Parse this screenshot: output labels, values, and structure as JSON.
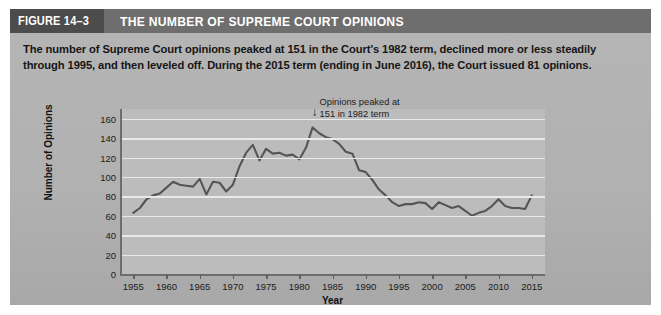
{
  "header": {
    "figure_number": "FIGURE 14–3",
    "figure_title": "THE NUMBER OF SUPREME COURT OPINIONS"
  },
  "caption": "The number of Supreme Court opinions peaked at 151 in the Court's 1982 term, declined more or less steadily through 1995, and then leveled off. During the 2015 term (ending in June 2016), the Court issued 81 opinions.",
  "annotation": {
    "line1": "Opinions peaked at",
    "line2": "151 in 1982 term",
    "arrow": "↓"
  },
  "colors": {
    "panel_background": "#b3b3b3",
    "header_band": "#6e6e6e",
    "figure_number_block": "#4c4c4c",
    "plot_background": "#bcbcbc",
    "gridline": "#e9e9e9",
    "line_series": "#555555",
    "axis": "#6d6d6d",
    "text": "#161616"
  },
  "chart_data": {
    "type": "line",
    "title": "THE NUMBER OF SUPREME COURT OPINIONS",
    "xlabel": "Year",
    "ylabel": "Number of Opinions",
    "xlim": [
      1953,
      2017
    ],
    "ylim": [
      0,
      170
    ],
    "yticks": [
      0,
      20,
      40,
      60,
      80,
      100,
      120,
      140,
      160
    ],
    "ytick_labels": [
      "0",
      "20",
      "40",
      "60",
      "80",
      "100",
      "120",
      "140",
      "160"
    ],
    "xticks": [
      1955,
      1960,
      1965,
      1970,
      1975,
      1980,
      1985,
      1990,
      1995,
      2000,
      2005,
      2010,
      2015
    ],
    "xtick_labels": [
      "1955",
      "1960",
      "1965",
      "1970",
      "1975",
      "1980",
      "1985",
      "1990",
      "1995",
      "2000",
      "2005",
      "2010",
      "2015"
    ],
    "grid": true,
    "legend": false,
    "series": [
      {
        "name": "Number of Opinions",
        "x": [
          1955,
          1956,
          1957,
          1958,
          1959,
          1960,
          1961,
          1962,
          1963,
          1964,
          1965,
          1966,
          1967,
          1968,
          1969,
          1970,
          1971,
          1972,
          1973,
          1974,
          1975,
          1976,
          1977,
          1978,
          1979,
          1980,
          1981,
          1982,
          1983,
          1984,
          1985,
          1986,
          1987,
          1988,
          1989,
          1990,
          1991,
          1992,
          1993,
          1994,
          1995,
          1996,
          1997,
          1998,
          1999,
          2000,
          2001,
          2002,
          2003,
          2004,
          2005,
          2006,
          2007,
          2008,
          2009,
          2010,
          2011,
          2012,
          2013,
          2014,
          2015
        ],
        "y": [
          63,
          68,
          77,
          81,
          83,
          89,
          95,
          92,
          91,
          90,
          98,
          82,
          95,
          94,
          85,
          92,
          111,
          125,
          133,
          117,
          129,
          124,
          125,
          122,
          123,
          118,
          130,
          151,
          145,
          141,
          139,
          134,
          126,
          124,
          107,
          105,
          97,
          87,
          81,
          74,
          70,
          72,
          72,
          74,
          73,
          67,
          74,
          71,
          68,
          70,
          65,
          60,
          63,
          65,
          70,
          77,
          70,
          68,
          68,
          67,
          81
        ]
      }
    ],
    "annotations": [
      {
        "text": "Opinions peaked at 151 in 1982 term",
        "x": 1982,
        "y": 151
      }
    ]
  }
}
